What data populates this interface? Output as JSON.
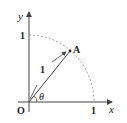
{
  "diagram": {
    "axis_x_label": "x",
    "axis_y_label": "y",
    "origin_label": "O",
    "x_tick_label": "1",
    "y_tick_label": "1",
    "point_label": "A",
    "segment_label": "1",
    "angle_label": "θ",
    "colors": {
      "line": "#444444",
      "arc": "#888888",
      "text": "#222222"
    }
  }
}
